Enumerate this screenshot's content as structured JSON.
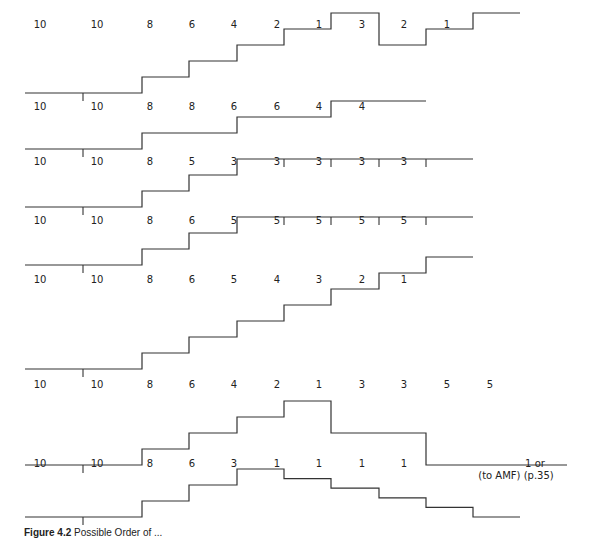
{
  "figure": {
    "caption_label": "Figure 4.2",
    "caption_text": "Possible Order of ..."
  },
  "layout": {
    "segment_x": [
      25,
      142,
      189,
      237,
      284,
      331,
      379,
      426,
      473,
      520,
      567
    ],
    "label_x": [
      40,
      97,
      150,
      192,
      234,
      277,
      319,
      362,
      404,
      447,
      490,
      535
    ],
    "step_height": 16,
    "stroke_color": "#333333"
  },
  "chart_data": {
    "type": "table",
    "rows": [
      {
        "labels": [
          "10",
          "10",
          "8",
          "6",
          "4",
          "2",
          "1",
          "3",
          "2",
          "1"
        ],
        "label_y": 28,
        "base_y": 93,
        "levels": [
          0,
          1,
          2,
          3,
          4,
          5,
          3,
          4,
          5
        ],
        "end_x": 520,
        "ticks": [
          83
        ]
      },
      {
        "labels": [
          "10",
          "10",
          "8",
          "8",
          "6",
          "6",
          "4",
          "4"
        ],
        "label_y": 110,
        "base_y": 149,
        "levels": [
          0,
          1,
          1,
          2,
          2,
          3,
          3
        ],
        "end_x": 426,
        "ticks": [
          83
        ]
      },
      {
        "labels": [
          "10",
          "10",
          "8",
          "5",
          "3",
          "3",
          "3",
          "3",
          "3"
        ],
        "label_y": 165,
        "base_y": 207,
        "levels": [
          0,
          1,
          2,
          3,
          3,
          3,
          3,
          3
        ],
        "end_x": 473,
        "ticks": [
          83,
          284,
          331,
          379,
          426
        ]
      },
      {
        "labels": [
          "10",
          "10",
          "8",
          "6",
          "5",
          "5",
          "5",
          "5",
          "5"
        ],
        "label_y": 224,
        "base_y": 265,
        "levels": [
          0,
          1,
          2,
          3,
          3,
          3,
          3,
          3
        ],
        "end_x": 473,
        "ticks": [
          83,
          284,
          331,
          379,
          426
        ]
      },
      {
        "labels": [
          "10",
          "10",
          "8",
          "6",
          "5",
          "4",
          "3",
          "2",
          "1"
        ],
        "label_y": 283,
        "base_y": 369,
        "levels": [
          0,
          1,
          2,
          3,
          4,
          5,
          6,
          7
        ],
        "end_x": 473,
        "ticks": [
          83
        ]
      },
      {
        "labels": [
          "10",
          "10",
          "8",
          "6",
          "4",
          "2",
          "1",
          "3",
          "3",
          "5",
          "5"
        ],
        "label_y": 388,
        "base_y": 465,
        "levels": [
          0,
          1,
          2,
          3,
          4,
          2,
          2,
          0,
          0
        ],
        "end_x": 567,
        "ticks": [
          83
        ]
      },
      {
        "labels": [
          "10",
          "10",
          "8",
          "6",
          "3",
          "1",
          "1",
          "1",
          "1"
        ],
        "label_y": 467,
        "base_y": 517,
        "levels": [
          0,
          1,
          2,
          3,
          2.4,
          1.8,
          1.2,
          0.6,
          0
        ],
        "end_x": 520,
        "ticks": [
          83
        ],
        "final_note_line1": "1 or",
        "final_note_line2": "(to AMF)  (p.35)"
      }
    ]
  }
}
